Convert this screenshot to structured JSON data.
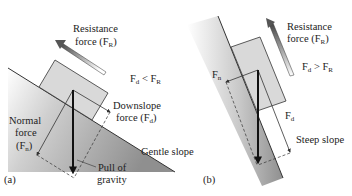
{
  "panel_a": {
    "label": "(a)",
    "resistance": {
      "line1": "Resistance",
      "line2": "force (F",
      "sub": "R",
      "close": ")"
    },
    "comparison": {
      "lhs": "F",
      "lhs_sub": "d",
      "op": " < ",
      "rhs": "F",
      "rhs_sub": "R"
    },
    "downslope": {
      "line1": "Downslope",
      "line2": "force (F",
      "sub": "d",
      "close": ")"
    },
    "normal": {
      "line1": "Normal",
      "line2": "force",
      "line3": "(F",
      "sub": "n",
      "close": ")"
    },
    "gravity": {
      "line1": "Pull of",
      "line2": "gravity"
    },
    "slope": "Gentle slope"
  },
  "panel_b": {
    "label": "(b)",
    "resistance": {
      "line1": "Resistance",
      "line2": "force (F",
      "sub": "R",
      "close": ")"
    },
    "comparison": {
      "lhs": "F",
      "lhs_sub": "d",
      "op": " > ",
      "rhs": "F",
      "rhs_sub": "R"
    },
    "fn": {
      "text": "F",
      "sub": "n"
    },
    "fd": {
      "text": "F",
      "sub": "d"
    },
    "slope": "Steep slope"
  },
  "colors": {
    "slope_dark": "#9a9a9a",
    "block_fill": "#d9d9d9",
    "line": "#333333",
    "arrow": "#111111"
  }
}
